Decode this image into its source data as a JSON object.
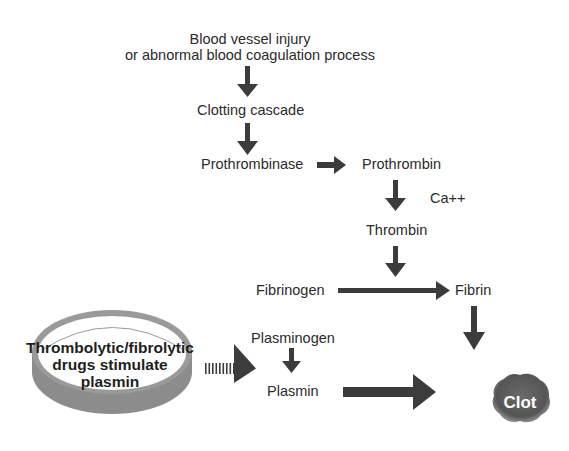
{
  "diagram": {
    "title_line1": "Blood vessel injury",
    "title_line2": "or abnormal blood coagulation process",
    "nodes": {
      "clotting_cascade": "Clotting cascade",
      "prothrombinase": "Prothrombinase",
      "prothrombin": "Prothrombin",
      "cofactor": "Ca++",
      "thrombin": "Thrombin",
      "fibrinogen": "Fibrinogen",
      "fibrin": "Fibrin",
      "plasminogen": "Plasminogen",
      "plasmin": "Plasmin",
      "clot": "Clot"
    },
    "drug": {
      "line1": "Thrombolytic/fibrolytic",
      "line2": "drugs stimulate",
      "line3": "plasmin"
    },
    "edges": [
      {
        "from": "Blood vessel injury",
        "to": "Clotting cascade"
      },
      {
        "from": "Clotting cascade",
        "to": "Prothrombinase"
      },
      {
        "from": "Prothrombinase",
        "to": "Prothrombin"
      },
      {
        "from": "Prothrombin",
        "to": "Thrombin",
        "label": "Ca++"
      },
      {
        "from": "Thrombin",
        "to": "Fibrinogen→Fibrin"
      },
      {
        "from": "Fibrinogen",
        "to": "Fibrin"
      },
      {
        "from": "Fibrin",
        "to": "Clot"
      },
      {
        "from": "Thrombolytic/fibrolytic drugs",
        "to": "Plasminogen",
        "style": "dashed"
      },
      {
        "from": "Plasminogen",
        "to": "Plasmin"
      },
      {
        "from": "Plasmin",
        "to": "Clot"
      }
    ],
    "colors": {
      "arrow": "#3c3c3c",
      "pill_rim": "#8a8a8a",
      "clot": "#5a5a5a"
    }
  }
}
